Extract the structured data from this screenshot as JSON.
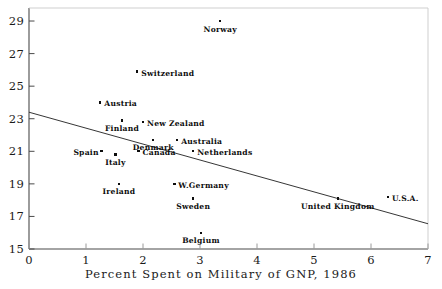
{
  "chart_data": {
    "type": "scatter",
    "title": "",
    "xlabel": "Percent Spent on Military of GNP, 1986",
    "ylabel": "",
    "xlim": [
      0,
      7
    ],
    "ylim": [
      15,
      29.8
    ],
    "xticks": [
      "0",
      "1",
      "2",
      "3",
      "4",
      "5",
      "6",
      "7"
    ],
    "yticks": [
      "15",
      "17",
      "19",
      "21",
      "23",
      "25",
      "27",
      "29"
    ],
    "grid": false,
    "legend": "none",
    "points": [
      {
        "label": "Norway",
        "x": 3.35,
        "y": 29.0,
        "label_pos": "below"
      },
      {
        "label": "Switzerland",
        "x": 1.9,
        "y": 25.9,
        "label_pos": "right"
      },
      {
        "label": "Austria",
        "x": 1.25,
        "y": 24.0,
        "label_pos": "right"
      },
      {
        "label": "Finland",
        "x": 1.63,
        "y": 22.9,
        "label_pos": "below"
      },
      {
        "label": "New Zealand",
        "x": 2.0,
        "y": 22.8,
        "label_pos": "right"
      },
      {
        "label": "Denmark",
        "x": 2.18,
        "y": 21.7,
        "label_pos": "below"
      },
      {
        "label": "Australia",
        "x": 2.6,
        "y": 21.7,
        "label_pos": "right"
      },
      {
        "label": "Spain",
        "x": 1.27,
        "y": 21.0,
        "label_pos": "left"
      },
      {
        "label": "Canada",
        "x": 1.92,
        "y": 21.0,
        "label_pos": "right"
      },
      {
        "label": "Netherlands",
        "x": 2.88,
        "y": 21.0,
        "label_pos": "right"
      },
      {
        "label": "Italy",
        "x": 1.52,
        "y": 20.8,
        "label_pos": "below"
      },
      {
        "label": "Ireland",
        "x": 1.58,
        "y": 19.0,
        "label_pos": "below"
      },
      {
        "label": "W.Germany",
        "x": 2.55,
        "y": 19.0,
        "label_pos": "right"
      },
      {
        "label": "Sweden",
        "x": 2.88,
        "y": 18.1,
        "label_pos": "below"
      },
      {
        "label": "Belgium",
        "x": 3.02,
        "y": 16.0,
        "label_pos": "below"
      },
      {
        "label": "United Kingdom",
        "x": 5.42,
        "y": 18.1,
        "label_pos": "below"
      },
      {
        "label": "U.S.A.",
        "x": 6.3,
        "y": 18.2,
        "label_pos": "right"
      }
    ],
    "trend_line": {
      "x_start": 0.0,
      "y_start": 23.4,
      "x_end": 7.0,
      "y_end": 16.55
    }
  }
}
